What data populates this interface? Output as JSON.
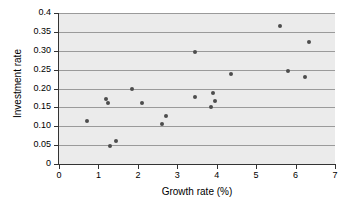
{
  "chart_data": {
    "type": "scatter",
    "title": "",
    "xlabel": "Growth rate (%)",
    "ylabel": "Investment rate",
    "xlim": [
      0,
      7
    ],
    "ylim": [
      0,
      0.4
    ],
    "grid": true,
    "grid_axis": "y",
    "legend": "none",
    "plot_background": "#ebebeb",
    "marker_color": "#4d4d4d",
    "gridline_color": "#9a9a9a",
    "axis_color": "#333333",
    "xticks": [
      0,
      1,
      2,
      3,
      4,
      5,
      6,
      7
    ],
    "xtick_labels": [
      "0",
      "1",
      "2",
      "3",
      "4",
      "5",
      "6",
      "7"
    ],
    "yticks": [
      0,
      0.05,
      0.1,
      0.15,
      0.2,
      0.25,
      0.3,
      0.35,
      0.4
    ],
    "ytick_labels": [
      "0",
      "0.05",
      "0.10",
      "0.15",
      "0.20",
      "0.25",
      "0.30",
      "0.35",
      "0.4"
    ],
    "points": [
      {
        "x": 0.7,
        "y": 0.113
      },
      {
        "x": 1.2,
        "y": 0.173
      },
      {
        "x": 1.25,
        "y": 0.163
      },
      {
        "x": 1.3,
        "y": 0.049
      },
      {
        "x": 1.45,
        "y": 0.061
      },
      {
        "x": 1.85,
        "y": 0.198
      },
      {
        "x": 2.1,
        "y": 0.161
      },
      {
        "x": 2.6,
        "y": 0.107
      },
      {
        "x": 2.7,
        "y": 0.126
      },
      {
        "x": 3.45,
        "y": 0.297
      },
      {
        "x": 3.45,
        "y": 0.177
      },
      {
        "x": 3.85,
        "y": 0.152
      },
      {
        "x": 3.9,
        "y": 0.188
      },
      {
        "x": 3.95,
        "y": 0.166
      },
      {
        "x": 4.35,
        "y": 0.239
      },
      {
        "x": 5.6,
        "y": 0.365
      },
      {
        "x": 5.8,
        "y": 0.247
      },
      {
        "x": 6.25,
        "y": 0.231
      },
      {
        "x": 6.35,
        "y": 0.323
      }
    ]
  }
}
